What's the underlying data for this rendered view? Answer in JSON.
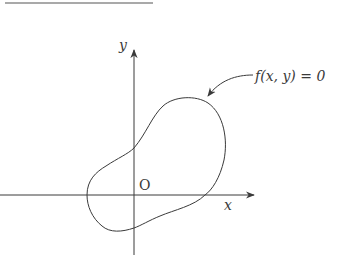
{
  "figure": {
    "top_rule": {
      "x1": 5,
      "x2": 153,
      "y": 3
    },
    "axes": {
      "x_axis": {
        "label": "x",
        "from": [
          0,
          195
        ],
        "to": [
          254,
          195
        ]
      },
      "y_axis": {
        "label": "y",
        "from": [
          134,
          258
        ],
        "to": [
          134,
          50
        ]
      },
      "origin_label": "O"
    },
    "curve": {
      "description": "closed smooth curve",
      "equation_label": "f(x,  y) = 0"
    },
    "colors": {
      "stroke": "#3a3a3a",
      "background": "#ffffff"
    }
  }
}
